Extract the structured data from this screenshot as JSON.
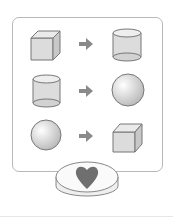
{
  "diagram": {
    "rows": [
      {
        "from": "cube",
        "to": "cylinder"
      },
      {
        "from": "cylinder",
        "to": "sphere"
      },
      {
        "from": "sphere",
        "to": "cube"
      }
    ],
    "arrow": "arrow-right",
    "base": {
      "shape": "disc",
      "symbol": "heart"
    },
    "colors": {
      "shape_fill": "#dedede",
      "outline": "#777777",
      "arrow": "#8a8a8a",
      "heart": "#6f6f6f",
      "panel_border": "#b8b8b8"
    }
  }
}
